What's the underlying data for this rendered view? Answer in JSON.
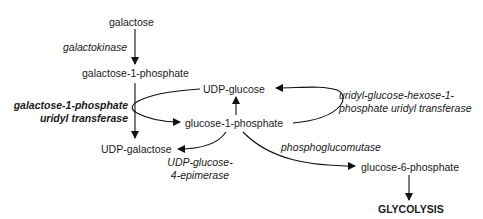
{
  "diagram": {
    "type": "metabolic-pathway",
    "metabolites": {
      "galactose": "galactose",
      "galactose_1_phosphate": "galactose-1-phosphate",
      "udp_glucose": "UDP-glucose",
      "glucose_1_phosphate": "glucose-1-phosphate",
      "udp_galactose": "UDP-galactose",
      "glucose_6_phosphate": "glucose-6-phosphate",
      "glycolysis": "GLYCOLYSIS"
    },
    "enzymes": {
      "galactokinase": "galactokinase",
      "galt_line1": "galactose-1-phosphate",
      "galt_line2": "uridyl transferase",
      "uhuT_line1": "uridyl-glucose-hexose-1-",
      "uhuT_line2": "phosphate uridyl transferase",
      "epimerase_line1": "UDP-glucose-",
      "epimerase_line2": "4-epimerase",
      "phosphoglucomutase": "phosphoglucomutase"
    },
    "edges": [
      {
        "from": "galactose",
        "to": "galactose-1-phosphate",
        "enzyme": "galactokinase"
      },
      {
        "from": "galactose-1-phosphate",
        "to": "UDP-galactose",
        "enzyme": "galactose-1-phosphate uridyl transferase"
      },
      {
        "from": "UDP-glucose",
        "to": "glucose-1-phosphate",
        "enzyme": "galactose-1-phosphate uridyl transferase"
      },
      {
        "from": "glucose-1-phosphate",
        "to": "UDP-glucose",
        "enzyme": "uridyl-glucose-hexose-1-phosphate uridyl transferase"
      },
      {
        "from": "glucose-1-phosphate",
        "to": "UDP-galactose",
        "enzyme": "UDP-glucose-4-epimerase"
      },
      {
        "from": "glucose-1-phosphate",
        "to": "glucose-6-phosphate",
        "enzyme": "phosphoglucomutase"
      },
      {
        "from": "glucose-6-phosphate",
        "to": "GLYCOLYSIS",
        "enzyme": ""
      }
    ]
  }
}
